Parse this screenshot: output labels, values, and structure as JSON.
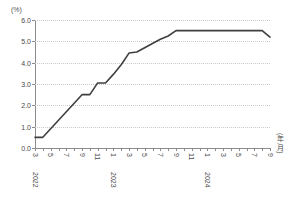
{
  "chart_data": {
    "type": "line",
    "title": "",
    "xlabel": "(年,月)",
    "ylabel": "(%)",
    "unit": "(%)",
    "ylim": [
      0.0,
      6.0
    ],
    "yticks": [
      "0.0",
      "1.0",
      "2.0",
      "3.0",
      "4.0",
      "5.0",
      "6.0"
    ],
    "ytick_values": [
      0.0,
      1.0,
      2.0,
      3.0,
      4.0,
      5.0,
      6.0
    ],
    "grid": true,
    "legend": null,
    "line_color": "#3f3f3f",
    "x": [
      "2022-3",
      "2022-4",
      "2022-5",
      "2022-6",
      "2022-7",
      "2022-8",
      "2022-9",
      "2022-10",
      "2022-11",
      "2022-12",
      "2023-1",
      "2023-2",
      "2023-3",
      "2023-4",
      "2023-5",
      "2023-6",
      "2023-7",
      "2023-8",
      "2023-9",
      "2023-10",
      "2023-11",
      "2023-12",
      "2024-1",
      "2024-2",
      "2024-3",
      "2024-4",
      "2024-5",
      "2024-6",
      "2024-7",
      "2024-8",
      "2024-9"
    ],
    "values": [
      0.5,
      0.5,
      0.9,
      1.3,
      1.7,
      2.1,
      2.5,
      2.5,
      3.05,
      3.05,
      3.45,
      3.9,
      4.45,
      4.5,
      4.7,
      4.9,
      5.1,
      5.25,
      5.5,
      5.5,
      5.5,
      5.5,
      5.5,
      5.5,
      5.5,
      5.5,
      5.5,
      5.5,
      5.5,
      5.5,
      5.2
    ],
    "xtick_labels": [
      {
        "index": 0,
        "month": "3",
        "year": "2022"
      },
      {
        "index": 2,
        "month": "5",
        "year": ""
      },
      {
        "index": 4,
        "month": "7",
        "year": ""
      },
      {
        "index": 6,
        "month": "9",
        "year": ""
      },
      {
        "index": 8,
        "month": "11",
        "year": ""
      },
      {
        "index": 10,
        "month": "1",
        "year": "2023"
      },
      {
        "index": 12,
        "month": "3",
        "year": ""
      },
      {
        "index": 14,
        "month": "5",
        "year": ""
      },
      {
        "index": 16,
        "month": "7",
        "year": ""
      },
      {
        "index": 18,
        "month": "9",
        "year": ""
      },
      {
        "index": 20,
        "month": "11",
        "year": ""
      },
      {
        "index": 22,
        "month": "1",
        "year": "2024"
      },
      {
        "index": 24,
        "month": "3",
        "year": ""
      },
      {
        "index": 26,
        "month": "5",
        "year": ""
      },
      {
        "index": 28,
        "month": "7",
        "year": ""
      },
      {
        "index": 30,
        "month": "9",
        "year": ""
      }
    ]
  }
}
